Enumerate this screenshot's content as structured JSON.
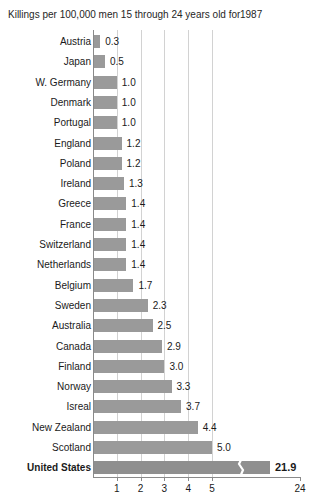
{
  "title": {
    "text": "Killings per 100,000 men 15 through 24 years old for",
    "year": "1987"
  },
  "chart_data": {
    "type": "bar",
    "orientation": "horizontal",
    "title": "Killings per 100,000 men 15 through 24 years old for 1987",
    "xlabel": "",
    "ylabel": "",
    "grid": true,
    "legend": null,
    "axis_break": true,
    "axis_break_note": "x-axis compressed between 5 and 24; United States bar drawn with a break mark",
    "xticks": [
      "1",
      "2",
      "3",
      "4",
      "5",
      "24"
    ],
    "xtick_values": [
      1,
      2,
      3,
      4,
      5,
      24
    ],
    "xlim": [
      0,
      24
    ],
    "categories": [
      "Austria",
      "Japan",
      "W. Germany",
      "Denmark",
      "Portugal",
      "England",
      "Poland",
      "Ireland",
      "Greece",
      "France",
      "Switzerland",
      "Netherlands",
      "Belgium",
      "Sweden",
      "Australia",
      "Canada",
      "Finland",
      "Norway",
      "Isreal",
      "New Zealand",
      "Scotland",
      "United States"
    ],
    "values": [
      0.3,
      0.5,
      1.0,
      1.0,
      1.0,
      1.2,
      1.2,
      1.3,
      1.4,
      1.4,
      1.4,
      1.4,
      1.7,
      2.3,
      2.5,
      2.9,
      3.0,
      3.3,
      3.7,
      4.4,
      5.0,
      21.9
    ],
    "value_labels": [
      "0.3",
      "0.5",
      "1.0",
      "1.0",
      "1.0",
      "1.2",
      "1.2",
      "1.3",
      "1.4",
      "1.4",
      "1.4",
      "1.4",
      "1.7",
      "2.3",
      "2.5",
      "2.9",
      "3.0",
      "3.3",
      "3.7",
      "4.4",
      "5.0",
      "21.9"
    ],
    "highlight": "United States",
    "colors": {
      "bar": "#9a9a9a",
      "bar_highlight": "#8f8f8f",
      "grid": "#d2d2d2",
      "axis": "#8a8a8a",
      "text": "#1a1a1a"
    }
  }
}
